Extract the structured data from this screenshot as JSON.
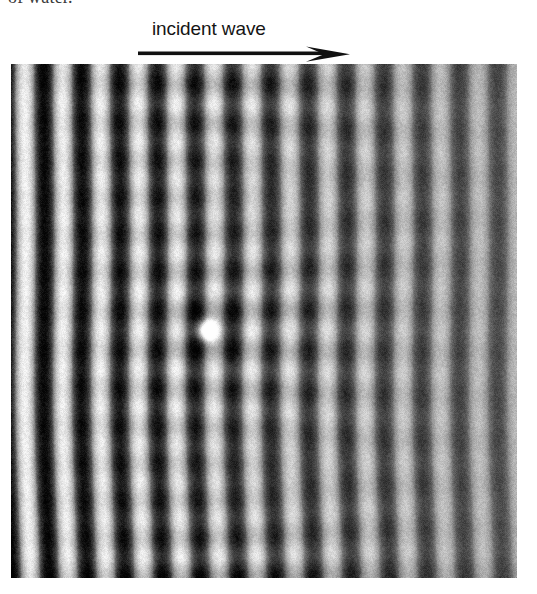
{
  "page": {
    "width": 537,
    "height": 594,
    "background": "#ffffff"
  },
  "caption_tail": {
    "text": "of water."
  },
  "annotation": {
    "label": "incident wave",
    "arrow_direction": "right",
    "arrow_color": "#111111"
  },
  "photo": {
    "alt": "Photograph of a plane water wave scattering from a small obstacle, showing vertical interference fringes",
    "left": 11,
    "top": 64,
    "width": 506,
    "height": 514,
    "fringe_orientation": "vertical",
    "fringe_period_px": 37.8,
    "fringe_phase_px": 22,
    "bright_fringe_x": [
      22,
      60,
      98,
      136,
      173,
      211,
      249,
      287,
      325,
      363,
      400,
      438,
      476,
      504
    ],
    "contrast_left": 0.97,
    "contrast_right": 0.42,
    "background_gray": "#6e6e6e",
    "scatterer": {
      "x": 195,
      "y": 266,
      "radius": 13,
      "bright": true
    },
    "standing_wave_lobes": {
      "center_x": 200,
      "spread_x": 140,
      "period_y": 38,
      "amplitude": 0.3
    },
    "grain_amount": 0.16
  },
  "chart_data": {
    "type": "heatmap",
    "title": "incident wave",
    "xlabel": "",
    "ylabel": "",
    "x": [
      22,
      60,
      98,
      136,
      173,
      211,
      249,
      287,
      325,
      363,
      400,
      438,
      476,
      504
    ],
    "values": [
      0.97,
      0.95,
      0.93,
      0.9,
      0.85,
      0.78,
      0.7,
      0.63,
      0.57,
      0.52,
      0.48,
      0.45,
      0.43,
      0.42
    ],
    "series": [
      {
        "name": "fringe contrast vs. x",
        "values": [
          0.97,
          0.95,
          0.93,
          0.9,
          0.85,
          0.78,
          0.7,
          0.63,
          0.57,
          0.52,
          0.48,
          0.45,
          0.43,
          0.42
        ]
      }
    ],
    "legend_position": "none",
    "grid": false
  }
}
